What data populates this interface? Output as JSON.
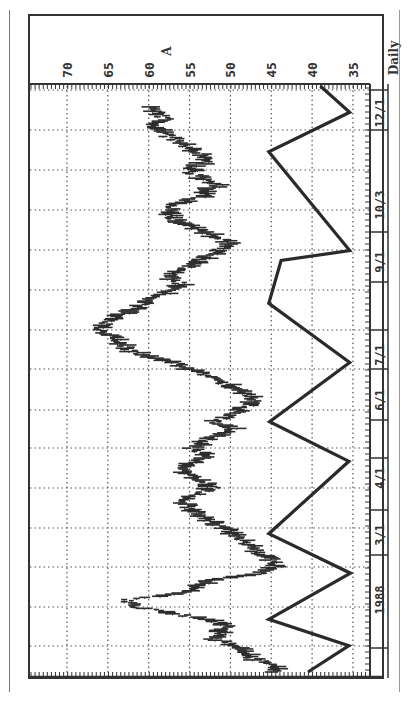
{
  "chart_data": {
    "type": "line",
    "orientation": "rotated-90-ccw",
    "title": "Daily",
    "marker_label": "A",
    "period_label": "Daily",
    "xlabel": "Date (1988)",
    "ylabel": "Price",
    "ylim": [
      33,
      71
    ],
    "y_ticks": [
      70,
      65,
      60,
      55,
      50,
      45,
      40,
      35
    ],
    "x_tick_labels": [
      "1988",
      "3/1",
      "4/1",
      "6/1",
      "7/1",
      "9/1",
      "10/3",
      "12/1"
    ],
    "grid": true,
    "series": [
      {
        "name": "Daily price bars (approx. close)",
        "style": "hlc-bars",
        "points": [
          {
            "t": 0,
            "v": 45.0
          },
          {
            "t": 2,
            "v": 44.4
          },
          {
            "t": 4,
            "v": 47.0
          },
          {
            "t": 6,
            "v": 48.5
          },
          {
            "t": 8,
            "v": 49.5
          },
          {
            "t": 10,
            "v": 52.0
          },
          {
            "t": 12,
            "v": 51.0
          },
          {
            "t": 14,
            "v": 50.5
          },
          {
            "t": 16,
            "v": 53.0
          },
          {
            "t": 18,
            "v": 57.5
          },
          {
            "t": 20,
            "v": 62.0
          },
          {
            "t": 22,
            "v": 62.8
          },
          {
            "t": 24,
            "v": 56.0
          },
          {
            "t": 26,
            "v": 54.5
          },
          {
            "t": 28,
            "v": 52.0
          },
          {
            "t": 30,
            "v": 46.0
          },
          {
            "t": 32,
            "v": 44.5
          },
          {
            "t": 34,
            "v": 45.0
          },
          {
            "t": 36,
            "v": 46.5
          },
          {
            "t": 38,
            "v": 47.5
          },
          {
            "t": 40,
            "v": 48.5
          },
          {
            "t": 42,
            "v": 49.5
          },
          {
            "t": 44,
            "v": 51.0
          },
          {
            "t": 46,
            "v": 52.5
          },
          {
            "t": 48,
            "v": 54.0
          },
          {
            "t": 50,
            "v": 55.0
          },
          {
            "t": 52,
            "v": 56.0
          },
          {
            "t": 54,
            "v": 54.5
          },
          {
            "t": 56,
            "v": 52.0
          },
          {
            "t": 58,
            "v": 53.5
          },
          {
            "t": 60,
            "v": 55.5
          },
          {
            "t": 62,
            "v": 56.5
          },
          {
            "t": 64,
            "v": 54.0
          },
          {
            "t": 66,
            "v": 53.0
          },
          {
            "t": 68,
            "v": 55.0
          },
          {
            "t": 70,
            "v": 53.0
          },
          {
            "t": 72,
            "v": 51.5
          },
          {
            "t": 74,
            "v": 50.0
          },
          {
            "t": 76,
            "v": 52.0
          },
          {
            "t": 78,
            "v": 50.5
          },
          {
            "t": 80,
            "v": 48.5
          },
          {
            "t": 82,
            "v": 47.0
          },
          {
            "t": 84,
            "v": 47.5
          },
          {
            "t": 86,
            "v": 49.0
          },
          {
            "t": 88,
            "v": 51.0
          },
          {
            "t": 90,
            "v": 53.0
          },
          {
            "t": 92,
            "v": 55.0
          },
          {
            "t": 94,
            "v": 57.0
          },
          {
            "t": 96,
            "v": 60.0
          },
          {
            "t": 98,
            "v": 62.5
          },
          {
            "t": 100,
            "v": 63.5
          },
          {
            "t": 102,
            "v": 64.5
          },
          {
            "t": 104,
            "v": 66.5
          },
          {
            "t": 106,
            "v": 65.0
          },
          {
            "t": 108,
            "v": 64.0
          },
          {
            "t": 110,
            "v": 62.0
          },
          {
            "t": 112,
            "v": 60.5
          },
          {
            "t": 114,
            "v": 59.0
          },
          {
            "t": 116,
            "v": 57.0
          },
          {
            "t": 118,
            "v": 56.0
          },
          {
            "t": 120,
            "v": 57.5
          },
          {
            "t": 122,
            "v": 56.5
          },
          {
            "t": 124,
            "v": 54.5
          },
          {
            "t": 126,
            "v": 53.0
          },
          {
            "t": 128,
            "v": 51.5
          },
          {
            "t": 130,
            "v": 50.0
          },
          {
            "t": 132,
            "v": 51.5
          },
          {
            "t": 134,
            "v": 53.5
          },
          {
            "t": 136,
            "v": 55.5
          },
          {
            "t": 138,
            "v": 57.0
          },
          {
            "t": 140,
            "v": 58.0
          },
          {
            "t": 142,
            "v": 56.5
          },
          {
            "t": 144,
            "v": 54.0
          },
          {
            "t": 146,
            "v": 53.0
          },
          {
            "t": 148,
            "v": 51.5
          },
          {
            "t": 150,
            "v": 53.5
          },
          {
            "t": 152,
            "v": 55.0
          },
          {
            "t": 154,
            "v": 54.0
          },
          {
            "t": 156,
            "v": 52.5
          },
          {
            "t": 158,
            "v": 54.0
          },
          {
            "t": 160,
            "v": 55.5
          },
          {
            "t": 162,
            "v": 57.0
          },
          {
            "t": 164,
            "v": 58.5
          },
          {
            "t": 166,
            "v": 59.0
          },
          {
            "t": 168,
            "v": 58.0
          },
          {
            "t": 170,
            "v": 59.0
          },
          {
            "t": 172,
            "v": 59.5
          }
        ]
      },
      {
        "name": "Cycle zigzag",
        "style": "heavy-line",
        "points": [
          {
            "t": 0,
            "v": 40.5
          },
          {
            "t": 8,
            "v": 35.5
          },
          {
            "t": 16,
            "v": 45.3
          },
          {
            "t": 30,
            "v": 35.3
          },
          {
            "t": 42,
            "v": 45.3
          },
          {
            "t": 64,
            "v": 35.5
          },
          {
            "t": 76,
            "v": 45.2
          },
          {
            "t": 94,
            "v": 35.4
          },
          {
            "t": 112,
            "v": 45.3
          },
          {
            "t": 125,
            "v": 43.8
          },
          {
            "t": 128,
            "v": 35.4
          },
          {
            "t": 158,
            "v": 45.3
          },
          {
            "t": 170,
            "v": 35.4
          },
          {
            "t": 178,
            "v": 39.0
          }
        ]
      }
    ]
  },
  "labels": {
    "period": "Daily",
    "marker": "A",
    "y_ticks": [
      "70",
      "65",
      "60",
      "55",
      "50",
      "45",
      "40",
      "35"
    ],
    "dates": [
      "12/1",
      "10/3",
      "9/1",
      "7/1",
      "6/1",
      "4/1",
      "3/1",
      "1988"
    ]
  },
  "colors": {
    "ink": "#2e2e2e",
    "grid": "#555555",
    "frame": "#333333",
    "background": "#ffffff"
  }
}
